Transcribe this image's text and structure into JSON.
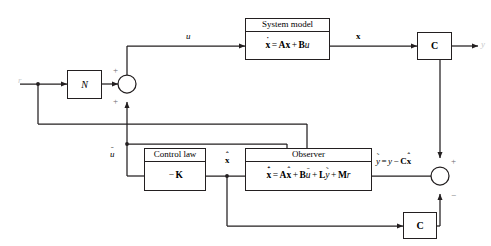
{
  "diagram": {
    "blocks": {
      "n_gain": {
        "label": "N"
      },
      "system_model": {
        "header": "System model",
        "equation": {
          "lhs_var": "x",
          "lhs_acc": "˙",
          "eq": "=",
          "terms": [
            "Ax",
            "Bu"
          ],
          "plain": "ẋ = Ax + Bu"
        }
      },
      "c_top": {
        "label": "C"
      },
      "control_law": {
        "header": "Control law",
        "equation": {
          "plain": "−K",
          "minus": "−",
          "gain": "K"
        }
      },
      "observer": {
        "header": "Observer",
        "equation": {
          "plain": "x̂̇ = Ax̂ + Bū + Lỹ + Mr"
        }
      },
      "c_bottom": {
        "label": "C"
      }
    },
    "signals": {
      "reference": "r",
      "control_input": "u",
      "state": "x",
      "output": "y",
      "control_estimate": "ū",
      "state_estimate": "x̂",
      "error": {
        "plain": "ỹ = y − Cx̂"
      }
    },
    "summing_junctions": {
      "left": {
        "sign_top": "+",
        "sign_bottom": "+"
      },
      "right": {
        "sign_top": "+",
        "sign_bottom": "−"
      }
    },
    "colors": {
      "line": "#231f20",
      "background": "#ffffff",
      "faint_label": "#c9cacb"
    }
  }
}
